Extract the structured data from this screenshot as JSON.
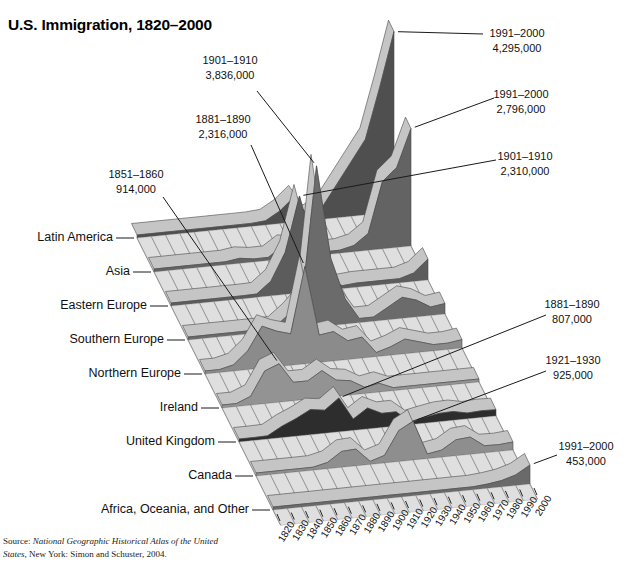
{
  "title": "U.S. Immigration, 1820–2000",
  "source": {
    "lines": [
      {
        "prefix": "Source: ",
        "italic": "National Geographic Historical Atlas of the United",
        "rest": ""
      },
      {
        "prefix": "",
        "italic": "States,",
        "rest": " New York: Simon and Schuster, 2004."
      }
    ]
  },
  "chart_data": {
    "type": "area",
    "projection": "3d-ridgeline",
    "title": "U.S. Immigration, 1820–2000",
    "unit": "immigrants per decade (millions, estimated from chart)",
    "x_ticks": [
      "1820",
      "1830",
      "1840",
      "1850",
      "1860",
      "1870",
      "1880",
      "1890",
      "1900",
      "1910",
      "1920",
      "1930",
      "1940",
      "1950",
      "1960",
      "1970",
      "1980",
      "1990",
      "2000"
    ],
    "decades": [
      "1821–1830",
      "1831–1840",
      "1841–1850",
      "1851–1860",
      "1861–1870",
      "1871–1880",
      "1881–1890",
      "1891–1900",
      "1901–1910",
      "1911–1920",
      "1921–1930",
      "1931–1940",
      "1941–1950",
      "1951–1960",
      "1961–1970",
      "1971–1980",
      "1981–1990",
      "1991–2000"
    ],
    "series": [
      {
        "name": "Latin America",
        "color": "#4f4f4f",
        "values": [
          0.01,
          0.02,
          0.02,
          0.02,
          0.02,
          0.03,
          0.03,
          0.04,
          0.1,
          0.3,
          0.6,
          0.1,
          0.3,
          0.8,
          1.3,
          1.8,
          3.0,
          4.295
        ]
      },
      {
        "name": "Asia",
        "color": "#636363",
        "values": [
          0.0,
          0.0,
          0.01,
          0.04,
          0.06,
          0.12,
          0.07,
          0.07,
          0.3,
          0.25,
          0.1,
          0.02,
          0.04,
          0.15,
          0.4,
          1.6,
          1.9,
          2.796
        ]
      },
      {
        "name": "Eastern Europe",
        "color": "#5c5c5c",
        "values": [
          0.0,
          0.0,
          0.0,
          0.01,
          0.01,
          0.08,
          0.35,
          1.0,
          2.31,
          1.0,
          0.25,
          0.05,
          0.1,
          0.1,
          0.1,
          0.1,
          0.2,
          0.5
        ]
      },
      {
        "name": "Southern Europe",
        "color": "#6b6b6b",
        "values": [
          0.0,
          0.0,
          0.0,
          0.01,
          0.02,
          0.08,
          0.35,
          0.7,
          3.836,
          1.6,
          0.6,
          0.1,
          0.1,
          0.3,
          0.5,
          0.4,
          0.2,
          0.25
        ]
      },
      {
        "name": "Northern Europe",
        "color": "#8b8b8b",
        "values": [
          0.01,
          0.15,
          0.45,
          1.0,
          0.85,
          0.75,
          2.316,
          0.65,
          0.7,
          0.45,
          0.5,
          0.1,
          0.2,
          0.35,
          0.25,
          0.15,
          0.15,
          0.2
        ]
      },
      {
        "name": "Ireland",
        "color": "#939393",
        "values": [
          0.05,
          0.21,
          0.78,
          0.914,
          0.44,
          0.44,
          0.65,
          0.39,
          0.34,
          0.15,
          0.21,
          0.01,
          0.02,
          0.06,
          0.04,
          0.01,
          0.03,
          0.06
        ]
      },
      {
        "name": "United Kingdom",
        "color": "#2d2d2d",
        "values": [
          0.03,
          0.08,
          0.27,
          0.42,
          0.6,
          0.55,
          0.807,
          0.27,
          0.5,
          0.34,
          0.34,
          0.03,
          0.14,
          0.2,
          0.21,
          0.14,
          0.16,
          0.15
        ]
      },
      {
        "name": "Canada",
        "color": "#8e8e8e",
        "values": [
          0.0,
          0.01,
          0.04,
          0.06,
          0.15,
          0.38,
          0.4,
          0.03,
          0.18,
          0.74,
          0.925,
          0.11,
          0.17,
          0.38,
          0.41,
          0.17,
          0.16,
          0.19
        ]
      },
      {
        "name": "Africa, Oceania, and Other",
        "color": "#6a6a6a",
        "values": [
          0.01,
          0.01,
          0.01,
          0.01,
          0.01,
          0.02,
          0.02,
          0.02,
          0.03,
          0.03,
          0.04,
          0.02,
          0.04,
          0.06,
          0.1,
          0.15,
          0.25,
          0.453
        ]
      }
    ],
    "callouts": [
      {
        "series": "Southern Europe",
        "period": "1901–1910",
        "value": "3,836,000"
      },
      {
        "series": "Latin America",
        "period": "1991–2000",
        "value": "4,295,000"
      },
      {
        "series": "Asia",
        "period": "1991–2000",
        "value": "2,796,000"
      },
      {
        "series": "Eastern Europe",
        "period": "1901–1910",
        "value": "2,310,000"
      },
      {
        "series": "Northern Europe",
        "period": "1881–1890",
        "value": "2,316,000"
      },
      {
        "series": "Ireland",
        "period": "1851–1860",
        "value": "914,000"
      },
      {
        "series": "United Kingdom",
        "period": "1881–1890",
        "value": "807,000"
      },
      {
        "series": "Canada",
        "period": "1921–1930",
        "value": "925,000"
      },
      {
        "series": "Africa, Oceania, and Other",
        "period": "1991–2000",
        "value": "453,000"
      }
    ]
  }
}
